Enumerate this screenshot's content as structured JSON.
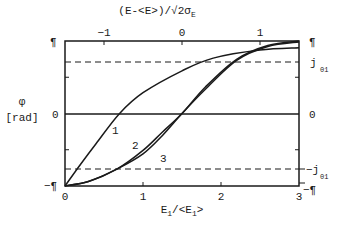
{
  "chart_data": {
    "type": "line",
    "title": "",
    "xlabel": "E1/<E1>",
    "xlabel_main": "E",
    "xlabel_sub": "1",
    "xlabel_rest": "/<E",
    "xlabel_sub2": "1",
    "xlabel_close": ">",
    "top_xlabel": "(E-<E>)/√2σ",
    "top_xlabel_sub": "E",
    "ylabel_symbol": "φ",
    "ylabel_unit": "[rad]",
    "xlim": [
      0,
      3
    ],
    "ylim": [
      -3.1416,
      3.1416
    ],
    "x_ticks": [
      "0",
      "1",
      "2",
      "3"
    ],
    "top_x_ticks": [
      "-1",
      "0",
      "1"
    ],
    "y_ticks_left": [
      "¶",
      "0",
      "-¶"
    ],
    "y_ticks_right": [
      "¶",
      "0",
      "-¶"
    ],
    "right_labels": {
      "upper_dashed": "j",
      "upper_dashed_sub": "01",
      "lower_dashed": "-j",
      "lower_dashed_sub": "01"
    },
    "dashed_lines": [
      {
        "name": "j01",
        "y": 2.4
      },
      {
        "name": "-j01",
        "y": -2.4
      }
    ],
    "horizontal_line": 0,
    "series": [
      {
        "name": "1",
        "x": [
          0,
          0.2,
          0.4,
          0.7,
          1.0,
          1.5,
          1.9,
          2.5,
          3.0
        ],
        "y": [
          -3.14,
          -2.2,
          -1.3,
          0,
          0.9,
          1.85,
          2.4,
          2.75,
          2.85
        ]
      },
      {
        "name": "2",
        "x": [
          0,
          0.3,
          0.67,
          1.0,
          1.25,
          1.5,
          1.8,
          2.2,
          2.6,
          3.0
        ],
        "y": [
          -3.14,
          -2.95,
          -2.4,
          -1.6,
          -0.8,
          0,
          1.15,
          2.35,
          2.95,
          3.14
        ]
      },
      {
        "name": "3",
        "x": [
          0,
          0.3,
          0.67,
          1.0,
          1.25,
          1.5,
          1.8,
          2.2,
          2.6,
          3.0
        ],
        "y": [
          -3.14,
          -2.95,
          -2.4,
          -1.75,
          -0.95,
          0,
          1.05,
          2.3,
          2.9,
          3.1
        ]
      }
    ],
    "curve_labels": [
      "1",
      "2",
      "3"
    ],
    "grid": false,
    "legend": "none (curves labeled inline)"
  }
}
